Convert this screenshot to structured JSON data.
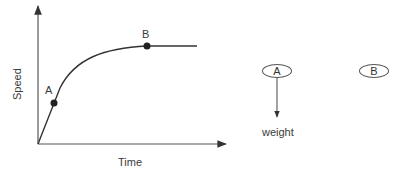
{
  "graph": {
    "x_axis_label": "Time",
    "y_axis_label": "Speed",
    "points": [
      {
        "label": "A",
        "description": "point on rising part of curve"
      },
      {
        "label": "B",
        "description": "point where curve levels off"
      }
    ]
  },
  "force_diagram": {
    "objects": [
      {
        "label": "A",
        "force_label": "weight"
      },
      {
        "label": "B"
      }
    ]
  },
  "colors": {
    "line": "#444444",
    "text": "#333333",
    "background": "#ffffff"
  }
}
